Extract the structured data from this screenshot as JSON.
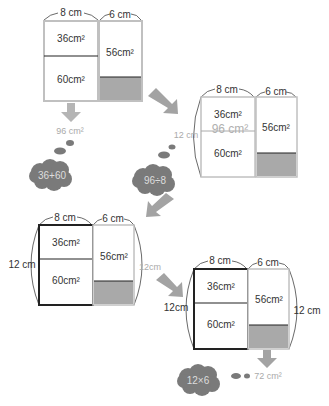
{
  "colors": {
    "shaded": "#a9a9a9",
    "arrow": "#a3a3a3",
    "cloud": "#7a7a7a",
    "light_border": "#c0c0c0",
    "dark_border": "#222222",
    "muted_text": "#b0b0b0"
  },
  "diagram1": {
    "width_left": "8 cm",
    "width_right": "6 cm",
    "area_top_left": "36cm²",
    "area_bottom_left": "60cm²",
    "area_right": "56cm²",
    "result": "96 cm²",
    "thought": "36+60"
  },
  "diagram2": {
    "width_left": "8 cm",
    "width_right": "6 cm",
    "height_left": "12 cm",
    "area_top_left": "36cm²",
    "area_overlay": "96 cm²",
    "area_bottom_left": "60cm²",
    "area_right": "56cm²",
    "thought": "96÷8"
  },
  "diagram3": {
    "width_left": "8 cm",
    "width_right": "6 cm",
    "height_left": "12 cm",
    "height_right": "12cm",
    "area_top_left": "36cm²",
    "area_bottom_left": "60cm²",
    "area_right": "56cm²"
  },
  "diagram4": {
    "width_left": "8 cm",
    "width_right": "6 cm",
    "height_left": "12cm",
    "height_right": "12 cm",
    "area_top_left": "36cm²",
    "area_bottom_left": "60cm²",
    "area_right": "56cm²",
    "thought": "12×6",
    "result": "72 cm²"
  }
}
